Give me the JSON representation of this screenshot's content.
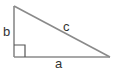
{
  "diagram": {
    "type": "right-triangle",
    "labels": {
      "a": "a",
      "b": "b",
      "c": "c"
    },
    "colors": {
      "line": "#8a8a8a",
      "text": "#333333",
      "background": "#ffffff"
    }
  }
}
